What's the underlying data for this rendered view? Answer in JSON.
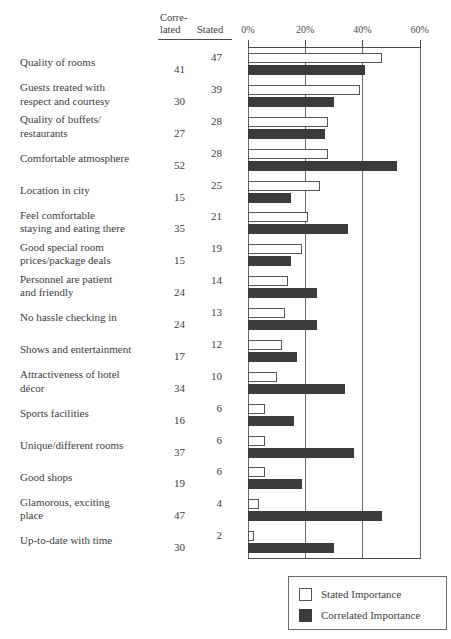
{
  "header": {
    "col_correlated_line1": "Corre-",
    "col_correlated_line2": "lated",
    "col_stated": "Stated"
  },
  "legend": {
    "stated_label": "Stated Importance",
    "correlated_label": "Correlated Importance",
    "stated_swatch": "stated-swatch",
    "correlated_swatch": "correlated-swatch"
  },
  "colors": {
    "stated_fill": "#ffffff",
    "stated_border": "#565656",
    "correlated_fill": "#3b3b3b",
    "axis": "#4a4a4a",
    "gridline": "#6b6b6b",
    "text": "#3c3c3c"
  },
  "chart_data": {
    "type": "bar",
    "title": "",
    "xlabel": "",
    "ylabel": "",
    "orientation": "horizontal",
    "xlim": [
      0,
      60
    ],
    "xticks": [
      0,
      20,
      40,
      60
    ],
    "xticklabels": [
      "0%",
      "20%",
      "40%",
      "60%"
    ],
    "grid": true,
    "legend_position": "bottom-right",
    "categories": [
      "Quality of rooms",
      "Guests treated with respect and courtesy",
      "Quality of buffets/restaurants",
      "Comfortable atmosphere",
      "Location in city",
      "Feel comfortable staying and eating there",
      "Good special room prices/package deals",
      "Personnel are patient and friendly",
      "No hassle checking in",
      "Shows and entertainment",
      "Attractiveness of hotel décor",
      "Sports facilities",
      "Unique/different rooms",
      "Good shops",
      "Glamorous, exciting place",
      "Up-to-date with time"
    ],
    "series": [
      {
        "name": "Stated Importance",
        "values": [
          47,
          39,
          28,
          28,
          25,
          21,
          19,
          14,
          13,
          12,
          10,
          6,
          6,
          6,
          4,
          2
        ]
      },
      {
        "name": "Correlated Importance",
        "values": [
          41,
          30,
          27,
          52,
          15,
          35,
          15,
          24,
          24,
          17,
          34,
          16,
          37,
          19,
          47,
          30
        ]
      }
    ]
  },
  "rows": [
    {
      "label_lines": [
        "Quality of rooms"
      ],
      "stated": "47",
      "correlated": "41"
    },
    {
      "label_lines": [
        "Guests treated with",
        "respect and courtesy"
      ],
      "stated": "39",
      "correlated": "30"
    },
    {
      "label_lines": [
        "Quality of buffets/",
        "restaurants"
      ],
      "stated": "28",
      "correlated": "27"
    },
    {
      "label_lines": [
        "Comfortable atmosphere"
      ],
      "stated": "28",
      "correlated": "52"
    },
    {
      "label_lines": [
        "Location in city"
      ],
      "stated": "25",
      "correlated": "15"
    },
    {
      "label_lines": [
        "Feel comfortable",
        "staying and eating there"
      ],
      "stated": "21",
      "correlated": "35"
    },
    {
      "label_lines": [
        "Good special room",
        "prices/package deals"
      ],
      "stated": "19",
      "correlated": "15"
    },
    {
      "label_lines": [
        "Personnel are patient",
        "and friendly"
      ],
      "stated": "14",
      "correlated": "24"
    },
    {
      "label_lines": [
        "No hassle checking in"
      ],
      "stated": "13",
      "correlated": "24"
    },
    {
      "label_lines": [
        "Shows and entertainment"
      ],
      "stated": "12",
      "correlated": "17"
    },
    {
      "label_lines": [
        "Attractiveness of hotel",
        "décor"
      ],
      "stated": "10",
      "correlated": "34"
    },
    {
      "label_lines": [
        "Sports facilities"
      ],
      "stated": "6",
      "correlated": "16"
    },
    {
      "label_lines": [
        "Unique/different rooms"
      ],
      "stated": "6",
      "correlated": "37"
    },
    {
      "label_lines": [
        "Good shops"
      ],
      "stated": "6",
      "correlated": "19"
    },
    {
      "label_lines": [
        "Glamorous, exciting",
        "place"
      ],
      "stated": "4",
      "correlated": "47"
    },
    {
      "label_lines": [
        "Up-to-date with time"
      ],
      "stated": "2",
      "correlated": "30"
    }
  ]
}
